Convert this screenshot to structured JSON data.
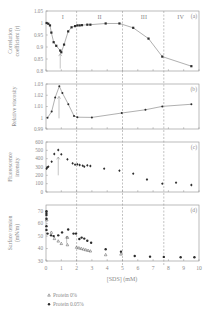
{
  "colors": {
    "axis": "#8e8e8e",
    "text": "#8a8a8a",
    "marker": "#2b2b2b",
    "line": "#7a7a7a",
    "dash": "#9a9a9a",
    "background": "#ffffff"
  },
  "chart_data": {
    "type": "line",
    "title": "",
    "x_axis": {
      "label": "[SDS] (mM)",
      "range": [
        0,
        10
      ],
      "ticks": [
        "0",
        "1",
        "2",
        "3",
        "4",
        "5",
        "6",
        "7",
        "8",
        "9",
        "10"
      ]
    },
    "region_boundaries": [
      2.0,
      5.0,
      7.7
    ],
    "regions": [
      {
        "label": "I",
        "x": 1.1
      },
      {
        "label": "II",
        "x": 3.5
      },
      {
        "label": "III",
        "x": 6.4
      },
      {
        "label": "IV",
        "x": 8.8
      }
    ],
    "grid": false,
    "panels": [
      {
        "id": "a",
        "tag": "(a)",
        "type": "line",
        "ylabel": [
          "Correlation",
          "coefficient (r)"
        ],
        "ylim": [
          0.8,
          1.05
        ],
        "yticks": [
          {
            "v": 0.8,
            "t": "0.8"
          },
          {
            "v": 0.85,
            "t": "0.85"
          },
          {
            "v": 0.9,
            "t": "0.9"
          },
          {
            "v": 0.95,
            "t": "0.95"
          },
          {
            "v": 1.0,
            "t": "1"
          },
          {
            "v": 1.05,
            "t": "1.05"
          }
        ],
        "arrow": {
          "x": 0.93,
          "from": 0.81,
          "to": 0.872
        },
        "series": [
          {
            "name": "Correlation coefficient",
            "marker": "square",
            "line": true,
            "x": [
              0.04,
              0.15,
              0.26,
              0.35,
              0.5,
              0.67,
              0.93,
              1.0,
              1.18,
              1.45,
              1.67,
              1.9,
              2.05,
              2.2,
              2.35,
              2.7,
              2.9,
              3.9,
              4.8,
              5.7,
              6.7,
              7.6,
              9.5
            ],
            "y": [
              1.0,
              0.997,
              0.99,
              0.96,
              0.92,
              0.905,
              0.885,
              0.878,
              0.91,
              0.965,
              0.982,
              0.987,
              0.99,
              0.99,
              0.991,
              0.993,
              0.993,
              0.998,
              0.998,
              0.98,
              0.935,
              0.86,
              0.82
            ]
          }
        ]
      },
      {
        "id": "b",
        "tag": "(b)",
        "type": "line",
        "ylabel": [
          "Relative viscosity"
        ],
        "ylim": [
          0.99,
          1.03
        ],
        "yticks": [
          {
            "v": 0.99,
            "t": "0.99"
          },
          {
            "v": 1.0,
            "t": "1"
          },
          {
            "v": 1.01,
            "t": "1.01"
          },
          {
            "v": 1.02,
            "t": "1.02"
          },
          {
            "v": 1.03,
            "t": "1.03"
          }
        ],
        "arrow": {
          "x": 0.85,
          "from": 0.9995,
          "to": 1.019
        },
        "series": [
          {
            "name": "Relative viscosity",
            "marker": "circle",
            "line": true,
            "x": [
              0.1,
              0.37,
              0.6,
              0.87,
              1.07,
              1.46,
              1.83,
              2.05,
              3.0,
              4.95,
              6.5,
              7.6,
              9.5
            ],
            "y": [
              1.0,
              1.0055,
              1.018,
              1.028,
              1.022,
              1.012,
              1.0016,
              1.0005,
              1.0003,
              1.0042,
              1.0071,
              1.0101,
              1.012
            ]
          }
        ]
      },
      {
        "id": "c",
        "tag": "(c)",
        "type": "scatter",
        "ylabel": [
          "Fluorescence",
          "intensity"
        ],
        "ylim": [
          0,
          600
        ],
        "yticks": [
          {
            "v": 0,
            "t": "0"
          },
          {
            "v": 100,
            "t": "100"
          },
          {
            "v": 200,
            "t": "200"
          },
          {
            "v": 300,
            "t": "300"
          },
          {
            "v": 400,
            "t": "400"
          },
          {
            "v": 500,
            "t": "500"
          },
          {
            "v": 600,
            "t": "600"
          }
        ],
        "arrow": {
          "x": 0.8,
          "from": 200,
          "to": 420
        },
        "series": [
          {
            "name": "Fluorescence intensity",
            "marker": "diamond",
            "line": false,
            "x": [
              0.04,
              0.08,
              0.15,
              0.37,
              0.54,
              0.8,
              1.0,
              1.4,
              1.74,
              1.9,
              2.05,
              2.2,
              2.4,
              2.5,
              2.7,
              2.9,
              3.8,
              4.8,
              5.7,
              6.6,
              7.6,
              8.5,
              9.5
            ],
            "y": [
              280,
              296,
              304,
              364,
              456,
              504,
              452,
              392,
              344,
              328,
              332,
              324,
              316,
              304,
              320,
              312,
              280,
              256,
              220,
              150,
              100,
              112,
              84
            ]
          }
        ]
      },
      {
        "id": "d",
        "tag": "(d)",
        "type": "scatter",
        "ylabel": [
          "Surface tension",
          "(mN/m)"
        ],
        "ylim": [
          30,
          75
        ],
        "yticks": [
          {
            "v": 30,
            "t": "30"
          },
          {
            "v": 40,
            "t": "40"
          },
          {
            "v": 50,
            "t": "50"
          },
          {
            "v": 60,
            "t": "60"
          },
          {
            "v": 70,
            "t": "70"
          }
        ],
        "arrow": {
          "x": 1.35,
          "from": 44,
          "to": 50
        },
        "series": [
          {
            "name": "Protein 0%",
            "marker": "triangle",
            "line": false,
            "x": [
              0.05,
              0.35,
              0.55,
              0.8,
              1.0,
              1.4,
              1.4,
              2.0,
              2.15,
              2.3,
              2.45,
              2.6,
              2.75,
              2.9,
              3.9,
              4.9
            ],
            "y": [
              63,
              53,
              48,
              46,
              44,
              49,
              43,
              41,
              40.5,
              40,
              39.5,
              39,
              38.5,
              38,
              35,
              35.5
            ]
          },
          {
            "name": "Protein 0.05%",
            "marker": "circle-filled",
            "line": false,
            "x": [
              0.03,
              0.03,
              0.03,
              0.03,
              0.03,
              0.03,
              0.1,
              0.33,
              0.5,
              0.8,
              1.05,
              1.45,
              1.8,
              1.96,
              2.18,
              2.33,
              2.5,
              2.7,
              2.95,
              3.9,
              4.9,
              5.8,
              6.8,
              7.7,
              8.8,
              9.7
            ],
            "y": [
              70,
              68.5,
              67,
              64,
              58,
              55,
              52,
              50.6,
              50,
              50.6,
              53,
              55.3,
              52,
              52,
              47.7,
              48.8,
              48,
              46.3,
              44.7,
              39.5,
              37.5,
              34,
              33.5,
              33.3,
              33,
              33
            ]
          }
        ]
      }
    ],
    "legend": [
      {
        "marker": "triangle",
        "label": "Protein 0%"
      },
      {
        "marker": "circle-filled",
        "label": "Protein 0.05%"
      }
    ],
    "legend_position": "bottom-left"
  }
}
